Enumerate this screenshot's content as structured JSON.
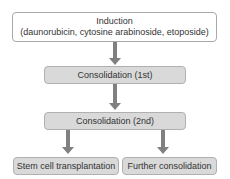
{
  "diagram": {
    "nodes": {
      "induction": {
        "title": "Induction",
        "subtitle": "(daunorubicin, cytosine arabinoside, etoposide)"
      },
      "consolidation_1": {
        "label": "Consolidation (1st)"
      },
      "consolidation_2": {
        "label": "Consolidation (2nd)"
      },
      "stem_cell": {
        "label": "Stem cell transplantation"
      },
      "further": {
        "label": "Further consolidation"
      }
    },
    "edges": [
      {
        "from": "Induction",
        "to": "Consolidation (1st)"
      },
      {
        "from": "Consolidation (1st)",
        "to": "Consolidation (2nd)"
      },
      {
        "from": "Consolidation (2nd)",
        "to": "Stem cell transplantation"
      },
      {
        "from": "Consolidation (2nd)",
        "to": "Further consolidation"
      }
    ],
    "colors": {
      "box_fill": "#d9d9d9",
      "box_border": "#b0b0b0",
      "arrow": "#808080",
      "text": "#333333"
    }
  }
}
